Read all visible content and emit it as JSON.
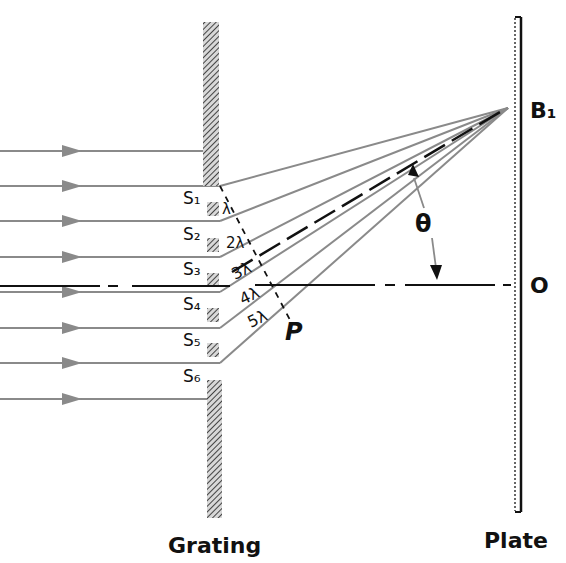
{
  "labels": {
    "grating": "Grating",
    "plate": "Plate",
    "image_point": "B₁",
    "center_point": "O",
    "angle": "θ",
    "perpendicular": "P"
  },
  "slits": [
    "S₁",
    "S₂",
    "S₃",
    "S₄",
    "S₅",
    "S₆"
  ],
  "path_differences": [
    "λ",
    "2λ",
    "3λ",
    "4λ",
    "5λ"
  ],
  "colors": {
    "ray": "#8a8a8a",
    "ink": "#111111",
    "grating_hatch": "#555555"
  }
}
